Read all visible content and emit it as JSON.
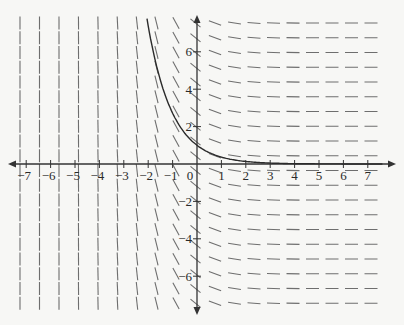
{
  "figure": {
    "differential_equation": "dy/dx = -e^{-x}",
    "solution_curve": "y = e^{-x}",
    "colors": {
      "background": "#f7f7f5",
      "axis": "#333333",
      "slope_segment": "#6e6e6e",
      "curve": "#2b2b2b",
      "label": "#2a2a2a"
    }
  },
  "axes": {
    "x_tick_labels": [
      "−7",
      "−6",
      "−5",
      "−4",
      "−3",
      "−2",
      "−1",
      "0",
      "1",
      "2",
      "3",
      "4",
      "5",
      "6",
      "7"
    ],
    "x_ticks": [
      -7,
      -6,
      -5,
      -4,
      -3,
      -2,
      -1,
      1,
      2,
      3,
      4,
      5,
      6,
      7
    ],
    "y_ticks": [
      6,
      4,
      2,
      -2,
      -4,
      -6
    ],
    "y_tick_labels": [
      "6",
      "4",
      "2",
      "−2",
      "−4",
      "−6"
    ],
    "origin_label": "0",
    "xlim": [
      -7.5,
      7.5
    ],
    "ylim": [
      -7.5,
      7.8
    ]
  },
  "chart_data": {
    "type": "line",
    "title": "",
    "xlabel": "",
    "ylabel": "",
    "xlim": [
      -7.5,
      7.5
    ],
    "ylim": [
      -7.5,
      7.8
    ],
    "grid": false,
    "series": [
      {
        "name": "solution y = e^(-x)",
        "x": [
          -2.05,
          -1.5,
          -1,
          -0.5,
          0,
          0.5,
          1,
          1.5,
          2,
          3,
          4,
          5,
          6,
          7.5
        ],
        "y": [
          7.77,
          4.48,
          2.72,
          1.65,
          1.0,
          0.61,
          0.37,
          0.22,
          0.14,
          0.05,
          0.02,
          0.01,
          0.0,
          0.0
        ]
      }
    ],
    "slope_field": {
      "slope_function": "-e^(-x)",
      "note": "slopes depend only on x; nearly vertical for x < -2, nearly horizontal for x > 2"
    }
  }
}
